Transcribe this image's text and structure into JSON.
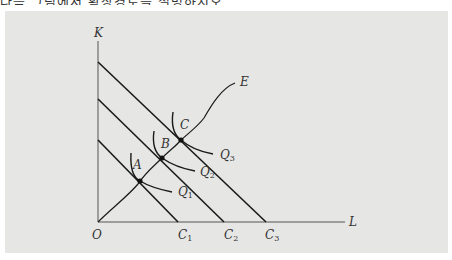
{
  "header_cutoff_text": "다음 그림에서 확장경로를 설명하시오",
  "diagram": {
    "type": "isoquant-isocost expansion path",
    "axes": {
      "y_label": "K",
      "x_label": "L",
      "origin_label": "O"
    },
    "isocost_lines": [
      {
        "label": "C",
        "sub": "1"
      },
      {
        "label": "C",
        "sub": "2"
      },
      {
        "label": "C",
        "sub": "3"
      }
    ],
    "isoquants": [
      {
        "label": "Q",
        "sub": "1"
      },
      {
        "label": "Q",
        "sub": "2"
      },
      {
        "label": "Q",
        "sub": "3"
      }
    ],
    "tangency_points": [
      "A",
      "B",
      "C"
    ],
    "expansion_path_label": "E",
    "colors": {
      "panel_bg": "#e6e6e4",
      "line": "#1a1a1a",
      "axis": "#555555",
      "text": "#333333"
    }
  }
}
